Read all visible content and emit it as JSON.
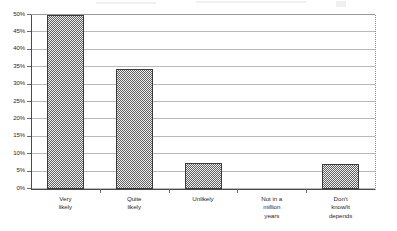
{
  "chart_data": {
    "type": "bar",
    "title": "",
    "subtitle": "",
    "xlabel": "",
    "ylabel": "",
    "categories": [
      "Very likely",
      "Quite likely",
      "Unlikely",
      "Not in a million years",
      "Don't know/it depends"
    ],
    "category_lines": [
      [
        "Very",
        "likely"
      ],
      [
        "Quite",
        "likely"
      ],
      [
        "Unlikely"
      ],
      [
        "Not in a",
        "million",
        "years"
      ],
      [
        "Don't",
        "know/it",
        "depends"
      ]
    ],
    "values": [
      50,
      34.5,
      7.5,
      0,
      7.2
    ],
    "value_labels": [
      "50%",
      "34.5%",
      "7.5%",
      "0%",
      "7.2%"
    ],
    "ylim": [
      0,
      50
    ],
    "ytick_values": [
      0,
      5,
      10,
      15,
      20,
      25,
      30,
      35,
      40,
      45,
      50
    ],
    "ytick_labels": [
      "0%",
      "5%",
      "10%",
      "15%",
      "20%",
      "25%",
      "30%",
      "35%",
      "40%",
      "45%",
      "50%"
    ],
    "grid": true,
    "grid_axis": "y",
    "legend": false,
    "legend_position": "none",
    "series": [
      {
        "name": "Responses",
        "values": [
          50,
          34.5,
          7.5,
          0,
          7.2
        ]
      }
    ],
    "colors": {
      "bar_fill": "#bdbdbd",
      "bar_pattern": "#5d5d5d",
      "bar_border": "#3b3b3b",
      "gridline": "#b9b9b9",
      "axis": "#4a4a4a",
      "frame_right": "#8d8d8d",
      "text": "#1f1f1f",
      "background": "#ffffff"
    }
  }
}
